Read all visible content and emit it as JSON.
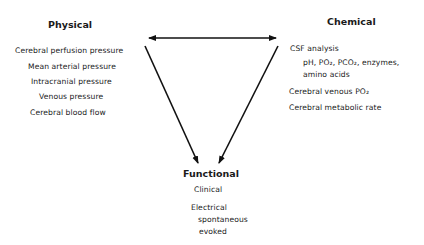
{
  "diagram": {
    "nodes": {
      "physical": {
        "title": "Physical",
        "items": [
          "Cerebral perfusion pressure",
          "Mean arterial pressure",
          "Intracranial pressure",
          "Venous pressure",
          "Cerebral blood flow"
        ]
      },
      "chemical": {
        "title": "Chemical",
        "items": [
          "CSF analysis",
          "pH, PO₂, PCO₂, enzymes,",
          "amino acids",
          "Cerebral venous PO₂",
          "Cerebral metabolic rate"
        ]
      },
      "functional": {
        "title": "Functional",
        "items": [
          "Clinical",
          "Electrical",
          "spontaneous",
          "evoked"
        ]
      }
    },
    "edges": [
      {
        "from": "physical",
        "to": "chemical",
        "type": "bidirectional"
      },
      {
        "from": "physical",
        "to": "functional",
        "type": "directed"
      },
      {
        "from": "chemical",
        "to": "functional",
        "type": "directed"
      }
    ],
    "line_color": "#111111"
  }
}
